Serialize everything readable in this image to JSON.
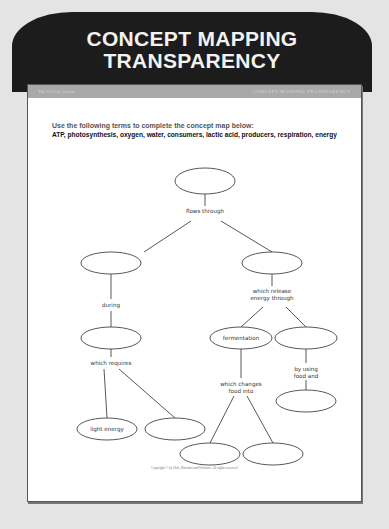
{
  "banner": {
    "title_line1": "CONCEPT MAPPING",
    "title_line2": "TRANSPARENCY"
  },
  "header_strip": {
    "left": "The Cell in Action",
    "right": "CONCEPT MAPPING TRANSPARENCY"
  },
  "instructions": {
    "prompt": "Use the following terms to complete the concept map below:",
    "terms": "ATP, photosynthesis, oxygen, water, consumers, lactic acid, producers, respiration, energy"
  },
  "concept_map": {
    "nodes": [
      {
        "id": "top",
        "label": ""
      },
      {
        "id": "left_1",
        "label": ""
      },
      {
        "id": "right_1",
        "label": ""
      },
      {
        "id": "left_2",
        "label": ""
      },
      {
        "id": "fermentation",
        "label": "fermentation"
      },
      {
        "id": "right_2",
        "label": ""
      },
      {
        "id": "light_energy",
        "label": "light energy"
      },
      {
        "id": "left_3",
        "label": ""
      },
      {
        "id": "ferm_out_1",
        "label": ""
      },
      {
        "id": "ferm_out_2",
        "label": ""
      },
      {
        "id": "right_3",
        "label": ""
      }
    ],
    "link_labels": {
      "flows_through": "flows through",
      "during": "during",
      "which_release_1": "which release",
      "which_release_2": "energy through",
      "which_requires": "which requires",
      "by_using_1": "by using",
      "by_using_2": "food and",
      "which_changes_1": "which changes",
      "which_changes_2": "food into"
    }
  },
  "footer": {
    "copyright": "Copyright © by Holt, Rinehart and Winston. All rights reserved."
  }
}
